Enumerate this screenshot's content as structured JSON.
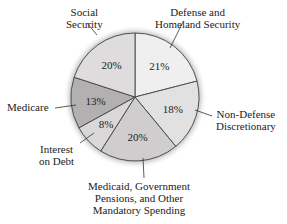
{
  "chart_data": {
    "type": "pie",
    "title": "",
    "categories": [
      "Defense and Homeland Security",
      "Non-Defense Discretionary",
      "Medicaid, Government Pensions, and Other Mandatory Spending",
      "Interest on Debt",
      "Medicare",
      "Social Security"
    ],
    "values": [
      21,
      18,
      20,
      8,
      13,
      20
    ],
    "labels": [
      "21%",
      "18%",
      "20%",
      "8%",
      "13%",
      "20%"
    ],
    "colors": [
      "#f0efef",
      "#e2e1e1",
      "#cfcdcd",
      "#d9d7d7",
      "#b2b0b0",
      "#dedcdc"
    ]
  },
  "labels": {
    "defense_1": "Defense and",
    "defense_2": "Homeland Security",
    "nondef_1": "Non-Defense",
    "nondef_2": "Discretionary",
    "medicaid_1": "Medicaid, Government",
    "medicaid_2": "Pensions, and Other",
    "medicaid_3": "Mandatory Spending",
    "interest_1": "Interest",
    "interest_2": "on Debt",
    "medicare": "Medicare",
    "social_1": "Social",
    "social_2": "Security"
  }
}
